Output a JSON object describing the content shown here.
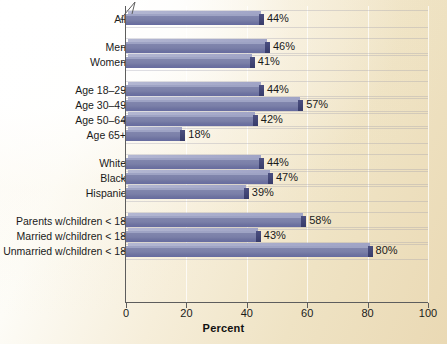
{
  "chart_data": {
    "type": "bar",
    "orientation": "horizontal",
    "title": "",
    "xlabel": "Percent",
    "ylabel": "",
    "xlim": [
      0,
      100
    ],
    "xticks": [
      0,
      20,
      40,
      60,
      80,
      100
    ],
    "grid": true,
    "legend": "none",
    "value_suffix": "%",
    "categories": [
      "All",
      "Men",
      "Women",
      "Age 18–29",
      "Age 30–49",
      "Age 50–64",
      "Age 65+",
      "White",
      "Black",
      "Hispanic",
      "Parents w/children < 18",
      "Married w/children < 18",
      "Unmarried w/children < 18"
    ],
    "values": [
      44,
      46,
      41,
      44,
      57,
      42,
      18,
      44,
      47,
      39,
      58,
      43,
      80
    ],
    "value_labels": [
      "44%",
      "46%",
      "41%",
      "44%",
      "57%",
      "42%",
      "18%",
      "44%",
      "47%",
      "39%",
      "58%",
      "43%",
      "80%"
    ],
    "groups": [
      {
        "name": "overall",
        "indices": [
          0
        ]
      },
      {
        "name": "gender",
        "indices": [
          1,
          2
        ]
      },
      {
        "name": "age",
        "indices": [
          3,
          4,
          5,
          6
        ]
      },
      {
        "name": "raceethnicity",
        "indices": [
          7,
          8,
          9
        ]
      },
      {
        "name": "parenting",
        "indices": [
          10,
          11,
          12
        ]
      }
    ]
  },
  "axis": {
    "x_tick_labels": [
      "0",
      "20",
      "40",
      "60",
      "80",
      "100"
    ],
    "x_title": "Percent"
  },
  "colors": {
    "bar_face": "#7a7fa8",
    "bar_top": "#a8accb",
    "bar_cap": "#41456f",
    "axis": "#5d5d5d",
    "text": "#1a1a1a",
    "background_light": "#ffffff",
    "background_tan": "#ead9b4",
    "gridline": "#9696aa"
  }
}
